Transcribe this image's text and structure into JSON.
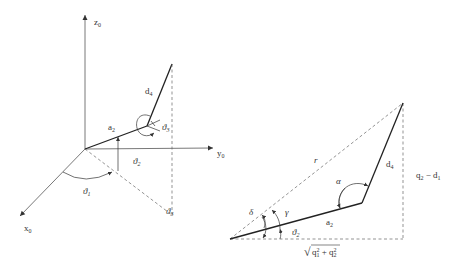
{
  "figure_left": {
    "title": "3D kinematic sketch",
    "axes": {
      "z": {
        "base": "z",
        "sub": "0"
      },
      "y": {
        "base": "y",
        "sub": "0"
      },
      "x": {
        "base": "x",
        "sub": "0"
      }
    },
    "links": {
      "a2": {
        "base": "a",
        "sub": "2"
      },
      "d4": {
        "base": "d",
        "sub": "4"
      }
    },
    "angles": {
      "theta1": {
        "base": "ϑ",
        "sub": "1"
      },
      "theta2": {
        "base": "ϑ",
        "sub": "2"
      },
      "theta3": {
        "base": "ϑ",
        "sub": "3"
      },
      "theta_proj": {
        "base": "ϑ",
        "sub": "3"
      }
    }
  },
  "figure_right": {
    "title": "Planar triangle construction",
    "labels": {
      "r": "r",
      "alpha": "α",
      "delta": "δ",
      "gamma": "γ",
      "a2": {
        "base": "a",
        "sub": "2"
      },
      "d4": {
        "base": "d",
        "sub": "4"
      },
      "theta2": {
        "base": "ϑ",
        "sub": "2"
      },
      "vertical": {
        "q": "q",
        "q_sub": "2",
        "minus": " − ",
        "d": "d",
        "d_sub": "1"
      },
      "horizontal": {
        "sqrt": "√",
        "q1": "q",
        "q1_sub": "1",
        "q1_sup": "2",
        "plus": " + ",
        "q2": "q",
        "q2_sub": "2",
        "q2_sup": "2"
      }
    }
  }
}
